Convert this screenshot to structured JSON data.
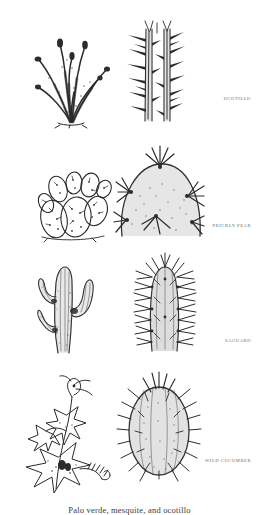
{
  "plate": {
    "background": "#ffffff",
    "ink_color": "#2a2a2a",
    "label_color": "#6d6d6d"
  },
  "rows": [
    {
      "label": "OCOTILLO",
      "habit": {
        "name": "ocotillo-habit-drawing",
        "description": "ocotillo shrub with long wand-like thorny stems fanning from base"
      },
      "detail": {
        "name": "ocotillo-stem-detail",
        "description": "close-up of ocotillo stem with large outward thorns"
      }
    },
    {
      "label": "PRICKLY PEAR",
      "habit": {
        "name": "prickly-pear-habit-drawing",
        "description": "prickly pear cactus with flat oval pads"
      },
      "detail": {
        "name": "prickly-pear-pad-detail",
        "description": "close-up of prickly pear pad edge with clustered radiating spines"
      }
    },
    {
      "label": "SAGUARO",
      "habit": {
        "name": "saguaro-habit-drawing",
        "description": "saguaro cactus with tall ribbed trunk and raised arms"
      },
      "detail": {
        "name": "saguaro-stem-detail",
        "description": "close-up of saguaro stem tip with dense spine clusters"
      }
    },
    {
      "label": "WILD CUCUMBER",
      "habit": {
        "name": "wild-cucumber-habit-drawing",
        "description": "wild cucumber vine with star-shaped lobed leaves, flower and curling tendrils"
      },
      "detail": {
        "name": "wild-cucumber-fruit-detail",
        "description": "spiny oval wild cucumber fruit"
      }
    }
  ],
  "caption": "Palo verde, mesquite, and ocotillo"
}
